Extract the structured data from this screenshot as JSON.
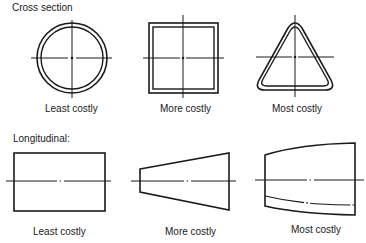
{
  "sections": {
    "cross_section": {
      "heading": "Cross section",
      "items": [
        {
          "shape": "circle",
          "label": "Least costly"
        },
        {
          "shape": "square",
          "label": "More costly"
        },
        {
          "shape": "rounded-triangle",
          "label": "Most costly"
        }
      ]
    },
    "longitudinal": {
      "heading": "Longitudinal:",
      "items": [
        {
          "shape": "rectangle",
          "label": "Least costly"
        },
        {
          "shape": "trapezoid-taper",
          "label": "More costly"
        },
        {
          "shape": "curved-taper",
          "label": "Most costly"
        }
      ]
    }
  },
  "colors": {
    "ink": "#1a1a1a",
    "background": "#ffffff"
  }
}
